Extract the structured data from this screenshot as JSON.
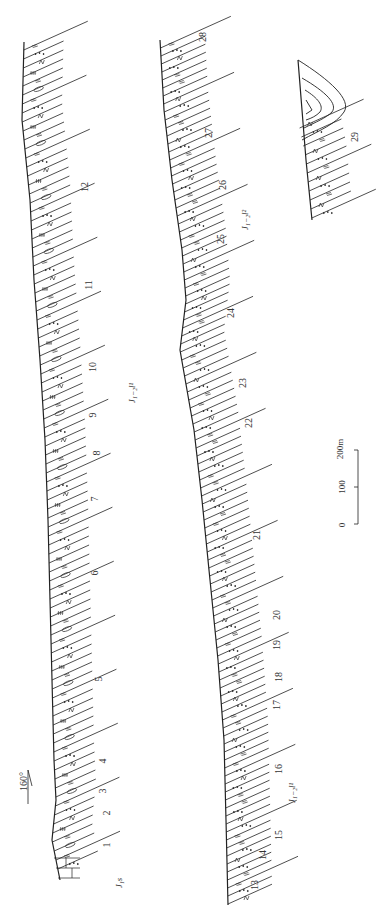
{
  "figure": {
    "type": "geological stratigraphic section (rotated 90°)",
    "direction": {
      "label": "160°"
    },
    "scale_bar": {
      "ticks": [
        "0",
        "100",
        "200m"
      ]
    },
    "formations": [
      {
        "id": "J1s",
        "label": "J₁s"
      },
      {
        "id": "J12l1",
        "label": "J₁₋₂l¹"
      },
      {
        "id": "J12l1b",
        "label": "J₁₋₂l¹"
      },
      {
        "id": "J12l2",
        "label": "J₁₋₂l²"
      }
    ],
    "columns": [
      {
        "name": "section-left",
        "layers": [
          "1",
          "2",
          "3",
          "4",
          "5",
          "6",
          "7",
          "8",
          "9",
          "10",
          "11",
          "12"
        ]
      },
      {
        "name": "section-middle",
        "layers": [
          "13",
          "14",
          "15",
          "16",
          "17",
          "18",
          "19",
          "20",
          "21",
          "22",
          "23",
          "24",
          "25",
          "26",
          "27",
          "28"
        ]
      },
      {
        "name": "section-right-fold",
        "layers": [
          "29"
        ]
      }
    ],
    "layer_labels": {
      "l1": "1",
      "l2": "2",
      "l3": "3",
      "l4": "4",
      "l5": "5",
      "l6": "6",
      "l7": "7",
      "l8": "8",
      "l9": "9",
      "l10": "10",
      "l11": "11",
      "l12": "12",
      "l13": "13",
      "l14": "14",
      "l15": "15",
      "l16": "16",
      "l17": "17",
      "l18": "18",
      "l19": "19",
      "l20": "20",
      "l21": "21",
      "l22": "22",
      "l23": "23",
      "l24": "24",
      "l25": "25",
      "l26": "26",
      "l27": "27",
      "l28": "28",
      "l29": "29"
    }
  }
}
